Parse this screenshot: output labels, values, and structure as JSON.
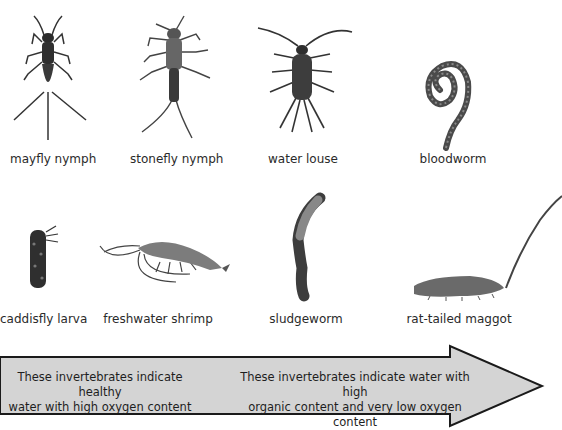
{
  "organisms_top": [
    {
      "label": "mayfly nymph"
    },
    {
      "label": "stonefly nymph"
    },
    {
      "label": "water louse"
    },
    {
      "label": "bloodworm"
    }
  ],
  "organisms_bottom": [
    {
      "label": "caddisfly larva"
    },
    {
      "label": "freshwater shrimp"
    },
    {
      "label": "sludgeworm"
    },
    {
      "label": "rat-tailed maggot"
    }
  ],
  "arrow": {
    "left_text_line1": "These invertebrates indicate healthy",
    "left_text_line2": "water with high oxygen content",
    "right_text_line1": "These invertebrates indicate water with high",
    "right_text_line2": "organic content and very low oxygen content",
    "fill_color": "#d4d4d4",
    "stroke_color": "#1a1a1a"
  }
}
